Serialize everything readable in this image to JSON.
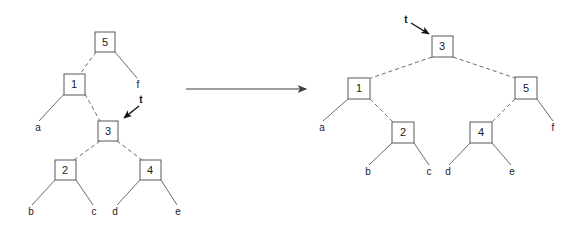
{
  "figure": {
    "background_color": "#ffffff",
    "line_color": "#6b6b6d",
    "text_color": "#1a1a1a",
    "transition_arrow": {
      "name": "transforms-into-arrow",
      "glyph": "→"
    }
  },
  "left_tree": {
    "caption": "before",
    "pointer": {
      "label": "t",
      "points_to": "3"
    },
    "nodes": [
      {
        "id": "L5",
        "label": "5",
        "x": 105,
        "y": 42
      },
      {
        "id": "L1",
        "label": "1",
        "x": 74,
        "y": 84
      },
      {
        "id": "L3",
        "label": "3",
        "x": 108,
        "y": 131
      },
      {
        "id": "L2",
        "label": "2",
        "x": 65,
        "y": 170
      },
      {
        "id": "L4",
        "label": "4",
        "x": 150,
        "y": 170
      }
    ],
    "leaves": [
      {
        "id": "La",
        "label": "a",
        "x": 38,
        "y": 128
      },
      {
        "id": "Lf",
        "label": "f",
        "x": 138,
        "y": 85
      },
      {
        "id": "Lb",
        "label": "b",
        "x": 31,
        "y": 212
      },
      {
        "id": "Lc",
        "label": "c",
        "x": 94,
        "y": 212
      },
      {
        "id": "Ld",
        "label": "d",
        "x": 115,
        "y": 212
      },
      {
        "id": "Le",
        "label": "e",
        "x": 178,
        "y": 212
      }
    ]
  },
  "right_tree": {
    "caption": "after",
    "pointer": {
      "label": "t",
      "points_to": "3"
    },
    "nodes": [
      {
        "id": "R3",
        "label": "3",
        "x": 442,
        "y": 46
      },
      {
        "id": "R1",
        "label": "1",
        "x": 359,
        "y": 88
      },
      {
        "id": "R5",
        "label": "5",
        "x": 526,
        "y": 88
      },
      {
        "id": "R2",
        "label": "2",
        "x": 403,
        "y": 132
      },
      {
        "id": "R4",
        "label": "4",
        "x": 481,
        "y": 132
      }
    ],
    "leaves": [
      {
        "id": "Ra",
        "label": "a",
        "x": 322,
        "y": 128
      },
      {
        "id": "Rf",
        "label": "f",
        "x": 553,
        "y": 128
      },
      {
        "id": "Rb",
        "label": "b",
        "x": 368,
        "y": 172
      },
      {
        "id": "Rc",
        "label": "c",
        "x": 429,
        "y": 172
      },
      {
        "id": "Rd",
        "label": "d",
        "x": 448,
        "y": 172
      },
      {
        "id": "Re",
        "label": "e",
        "x": 512,
        "y": 172
      }
    ]
  }
}
